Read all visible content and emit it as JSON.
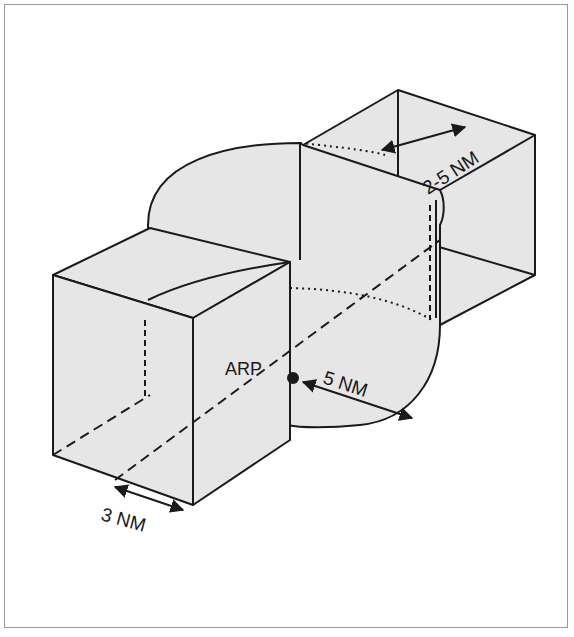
{
  "figure": {
    "type": "airspace-diagram",
    "colors": {
      "fill": "#e6e6e6",
      "stroke": "#1a1a1a",
      "frame": "#9a9a9a",
      "background": "#ffffff"
    }
  },
  "labels": {
    "arp": "ARP",
    "radius": "5 NM",
    "extension_length": "2-5 NM",
    "extension_width": "3 NM"
  }
}
